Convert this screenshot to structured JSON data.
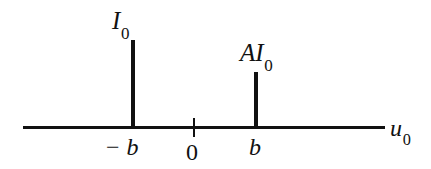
{
  "chart_data": {
    "type": "bar",
    "title": "",
    "subtitle": "",
    "xlabel": "u0",
    "ylabel": "",
    "grid": false,
    "legend": "none",
    "xlim": [
      -1.55,
      1.7
    ],
    "ylim": [
      0,
      1.15
    ],
    "categories": [
      "-b",
      "b"
    ],
    "values": [
      1.0,
      0.636
    ],
    "x_tick_labels": [
      "- b",
      "0",
      "b"
    ],
    "x_tick_values": [
      -1,
      0,
      1
    ],
    "series": [
      {
        "name": "spectral lines",
        "points": [
          {
            "x": -1,
            "x_label": "- b",
            "y": 1.0,
            "y_label": "I0"
          },
          {
            "x": 1,
            "x_label": "b",
            "y": 0.636,
            "y_label": "AI0"
          }
        ]
      }
    ],
    "annotations": [
      {
        "name": "amplitude-left",
        "text": "I0",
        "math": true
      },
      {
        "name": "amplitude-right",
        "text": "AI0",
        "math": true
      },
      {
        "name": "axis-variable",
        "text": "u0",
        "math": true
      }
    ]
  },
  "figure": {
    "axis": {
      "variable_symbol": "u",
      "variable_subscript": "0",
      "origin_label": "0"
    },
    "spikes": [
      {
        "name": "spike-left",
        "amplitude_symbol": "I",
        "amplitude_subscript": "0",
        "amplitude_prefix": "",
        "position_minus": "−",
        "position_symbol": "b"
      },
      {
        "name": "spike-right",
        "amplitude_symbol": "I",
        "amplitude_subscript": "0",
        "amplitude_prefix": "A",
        "position_minus": "",
        "position_symbol": "b"
      }
    ],
    "colors": {
      "ink": "#111111",
      "background": "#ffffff"
    }
  }
}
